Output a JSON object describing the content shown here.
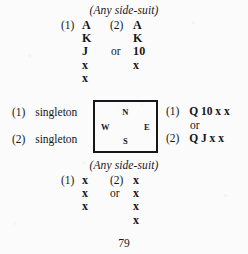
{
  "page": {
    "page_number": "79",
    "side_suit_label": "(Any side-suit)"
  },
  "top_holding": {
    "heading": "(Any side-suit)",
    "or_label": "or",
    "option_1": {
      "marker": "(1)",
      "cards": [
        "A",
        "K",
        "J",
        "x",
        "x"
      ]
    },
    "option_2": {
      "marker": "(2)",
      "cards": [
        "A",
        "K",
        "10",
        "x"
      ]
    }
  },
  "west_hand": {
    "option_1": {
      "marker": "(1)",
      "text": "singleton"
    },
    "option_2": {
      "marker": "(2)",
      "text": "singleton"
    }
  },
  "east_hand": {
    "or_label": "or",
    "option_1": {
      "marker": "(1)",
      "text": "Q 10 x x"
    },
    "option_2": {
      "marker": "(2)",
      "text": "Q J x x"
    }
  },
  "compass": {
    "north": "N",
    "south": "S",
    "west": "W",
    "east": "E"
  },
  "bottom_holding": {
    "heading": "(Any side-suit)",
    "or_label": "or",
    "option_1": {
      "marker": "(1)",
      "cards": [
        "x",
        "x",
        "x"
      ]
    },
    "option_2": {
      "marker": "(2)",
      "cards": [
        "x",
        "x",
        "x",
        "x"
      ]
    }
  }
}
